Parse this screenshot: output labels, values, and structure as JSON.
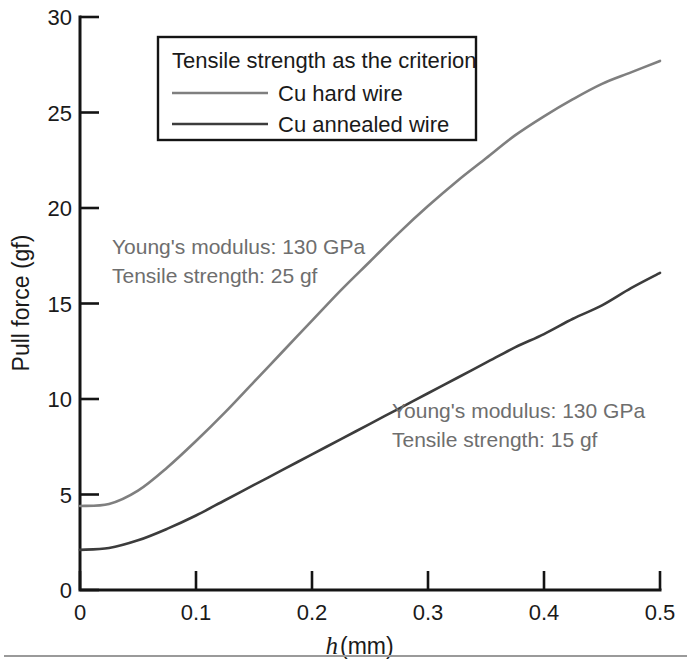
{
  "chart_data": {
    "type": "line",
    "title": "",
    "subtitle": "",
    "xlabel": "h (mm)",
    "xlabel_italic_part": "h",
    "xlabel_rest": " (mm)",
    "ylabel": "Pull force (gf)",
    "xlim": [
      0,
      0.5
    ],
    "ylim": [
      0,
      30
    ],
    "xticks": [
      0,
      0.1,
      0.2,
      0.3,
      0.4,
      0.5
    ],
    "xticklabels": [
      "0",
      "0.1",
      "0.2",
      "0.3",
      "0.4",
      "0.5"
    ],
    "yticks": [
      0,
      5,
      10,
      15,
      20,
      25,
      30
    ],
    "yticklabels": [
      "0",
      "5",
      "10",
      "15",
      "20",
      "25",
      "30"
    ],
    "grid": false,
    "legend_position": "upper-left-inside",
    "legend_title": "Tensile strength as the criterion",
    "x": [
      0.0,
      0.025,
      0.05,
      0.075,
      0.1,
      0.125,
      0.15,
      0.175,
      0.2,
      0.225,
      0.25,
      0.275,
      0.3,
      0.325,
      0.35,
      0.375,
      0.4,
      0.425,
      0.45,
      0.475,
      0.5
    ],
    "series": [
      {
        "name": "Cu hard wire",
        "color": "#7f7f7f",
        "values": [
          4.4,
          4.5,
          5.2,
          6.4,
          7.8,
          9.3,
          10.9,
          12.5,
          14.1,
          15.7,
          17.2,
          18.7,
          20.1,
          21.4,
          22.6,
          23.8,
          24.8,
          25.7,
          26.5,
          27.1,
          27.7
        ]
      },
      {
        "name": "Cu annealed wire",
        "color": "#3c3c3c",
        "values": [
          2.1,
          2.2,
          2.6,
          3.2,
          3.9,
          4.7,
          5.5,
          6.3,
          7.1,
          7.9,
          8.7,
          9.5,
          10.3,
          11.1,
          11.9,
          12.7,
          13.4,
          14.2,
          14.9,
          15.8,
          16.6
        ]
      }
    ],
    "annotations": [
      {
        "name": "hard-wire-annotation",
        "lines": [
          "Young's modulus: 130 GPa",
          "Tensile strength: 25 gf"
        ],
        "line1": "Young's modulus: 130 GPa",
        "line2": "Tensile strength: 25 gf",
        "color": "#6e6e6e"
      },
      {
        "name": "annealed-wire-annotation",
        "lines": [
          "Young's modulus: 130 GPa",
          "Tensile strength: 15 gf"
        ],
        "line1": "Young's modulus: 130 GPa",
        "line2": "Tensile strength: 15 gf",
        "color": "#6e6e6e"
      }
    ]
  },
  "legend": {
    "title": "Tensile strength as the criterion",
    "entries": [
      {
        "label": "Cu hard wire",
        "color": "#7f7f7f"
      },
      {
        "label": "Cu annealed wire",
        "color": "#3c3c3c"
      }
    ]
  },
  "axes": {
    "y_title": "Pull force (gf)",
    "x_title_italic": "h",
    "x_title_rest": " (mm)",
    "y_tick_0": "0",
    "y_tick_5": "5",
    "y_tick_10": "10",
    "y_tick_15": "15",
    "y_tick_20": "20",
    "y_tick_25": "25",
    "y_tick_30": "30",
    "x_tick_0": "0",
    "x_tick_1": "0.1",
    "x_tick_2": "0.2",
    "x_tick_3": "0.3",
    "x_tick_4": "0.4",
    "x_tick_5": "0.5"
  },
  "colors": {
    "axis": "#141414",
    "hard_wire": "#7f7f7f",
    "annealed_wire": "#3c3c3c",
    "annotation": "#6e6e6e",
    "rule": "#9a9a9a",
    "background": "#ffffff"
  }
}
